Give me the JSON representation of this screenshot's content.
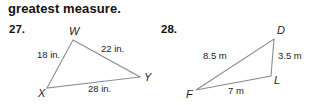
{
  "worksheet": {
    "prompt": "greatest measure.",
    "problems": [
      {
        "number": "27.",
        "figure": {
          "shape": "triangle",
          "vertices": [
            {
              "name": "W",
              "label": "W",
              "x": 73,
              "y": 40
            },
            {
              "name": "Y",
              "label": "Y",
              "x": 140,
              "y": 77
            },
            {
              "name": "X",
              "label": "X",
              "x": 47,
              "y": 88
            }
          ],
          "sides": [
            {
              "name": "WX",
              "label": "18 in.",
              "label_x": 37,
              "label_y": 49
            },
            {
              "name": "WY",
              "label": "22 in.",
              "label_x": 101,
              "label_y": 43
            },
            {
              "name": "XY",
              "label": "28 in.",
              "label_x": 88,
              "label_y": 83
            }
          ]
        }
      },
      {
        "number": "28.",
        "figure": {
          "shape": "triangle",
          "vertices": [
            {
              "name": "D",
              "label": "D",
              "x": 274,
              "y": 39
            },
            {
              "name": "L",
              "label": "L",
              "x": 271,
              "y": 76
            },
            {
              "name": "F",
              "label": "F",
              "x": 196,
              "y": 90
            }
          ],
          "sides": [
            {
              "name": "DF",
              "label": "8.5 m",
              "label_x": 203,
              "label_y": 50
            },
            {
              "name": "DL",
              "label": "3.5 m",
              "label_x": 278,
              "label_y": 50
            },
            {
              "name": "FL",
              "label": "7 m",
              "label_x": 228,
              "label_y": 85
            }
          ]
        }
      }
    ]
  },
  "colors": {
    "line": "#8d8d8d",
    "text": "#1d1d1d",
    "background": "#ffffff"
  }
}
